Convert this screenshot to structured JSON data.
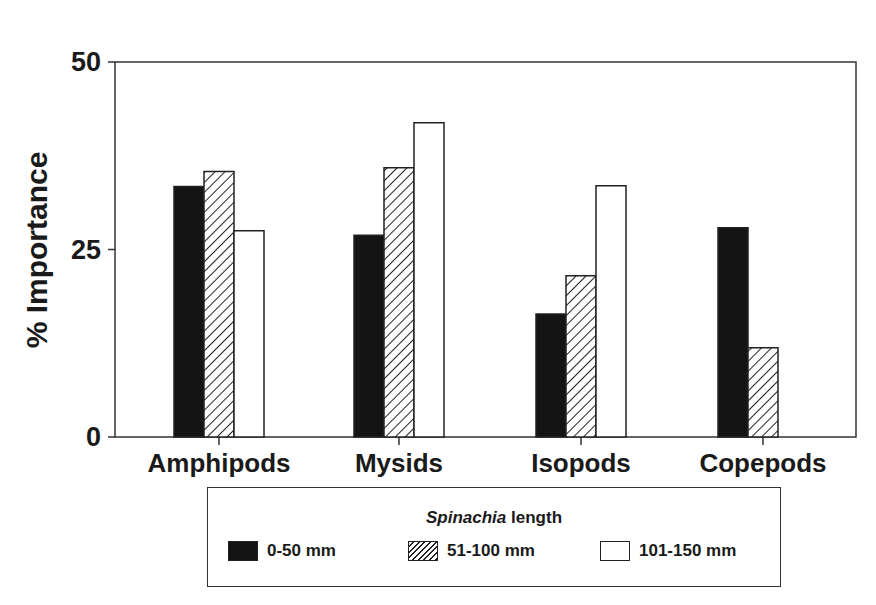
{
  "chart_data": {
    "type": "bar",
    "title": "",
    "xlabel": "",
    "ylabel": "% Importance",
    "ylim": [
      0,
      50
    ],
    "yticks": [
      0,
      25,
      50
    ],
    "grid": false,
    "legend_position": "bottom",
    "legend_title_italic": "Spinachia",
    "legend_title_rest": " length",
    "categories": [
      "Amphipods",
      "Mysids",
      "Isopods",
      "Copepods"
    ],
    "series": [
      {
        "name": "0-50 mm",
        "fill": "black",
        "values": [
          33.4,
          26.9,
          16.4,
          27.9
        ]
      },
      {
        "name": "51-100 mm",
        "fill": "hatched",
        "values": [
          35.4,
          35.9,
          21.5,
          11.9
        ]
      },
      {
        "name": "101-150 mm",
        "fill": "white",
        "values": [
          27.5,
          41.9,
          33.5,
          0
        ]
      }
    ]
  },
  "axis": {
    "ylabel": "% Importance",
    "ytick_labels": [
      "0",
      "25",
      "50"
    ]
  },
  "legend": {
    "title_italic": "Spinachia",
    "title_rest": " length",
    "items": [
      "0-50 mm",
      "51-100 mm",
      "101-150 mm"
    ]
  }
}
